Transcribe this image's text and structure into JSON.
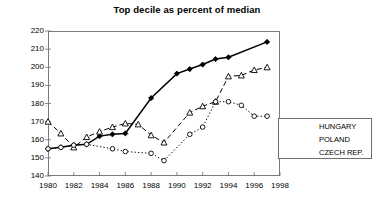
{
  "chart_data": {
    "type": "line",
    "title": "Top decile as percent of median",
    "xlabel": "",
    "ylabel": "",
    "xlim": [
      1980,
      1998
    ],
    "ylim": [
      140,
      220
    ],
    "xticks": [
      1980,
      1982,
      1984,
      1986,
      1988,
      1990,
      1992,
      1994,
      1996,
      1998
    ],
    "yticks": [
      140,
      150,
      160,
      170,
      180,
      190,
      200,
      210,
      220
    ],
    "grid": false,
    "legend_position": "right",
    "series": [
      {
        "name": "HUNGARY",
        "marker": "diamond-filled",
        "linestyle": "solid",
        "color": "#000000",
        "x": [
          1980,
          1981,
          1982,
          1983,
          1984,
          1985,
          1986,
          1988,
          1990,
          1991,
          1992,
          1993,
          1994,
          1997
        ],
        "values": [
          155,
          155.8,
          157,
          157.5,
          162,
          163,
          163.5,
          183,
          196.5,
          199,
          201.5,
          204.5,
          205.5,
          214
        ]
      },
      {
        "name": "POLAND",
        "marker": "triangle-open",
        "linestyle": "dashed",
        "color": "#000000",
        "x": [
          1980,
          1981,
          1982,
          1983,
          1984,
          1985,
          1986,
          1987,
          1988,
          1989,
          1991,
          1992,
          1993,
          1994,
          1995,
          1996,
          1997
        ],
        "values": [
          170,
          163.5,
          155.8,
          161.5,
          164.5,
          167,
          169,
          168.5,
          162.5,
          158.5,
          175,
          178.5,
          181,
          195,
          195.5,
          198.5,
          200
        ]
      },
      {
        "name": "CZECH REP.",
        "marker": "circle-open",
        "linestyle": "dotted",
        "color": "#000000",
        "x": [
          1980,
          1981,
          1982,
          1983,
          1985,
          1986,
          1988,
          1989,
          1991,
          1992,
          1993,
          1994,
          1995,
          1996,
          1997
        ],
        "values": [
          155,
          155.8,
          157,
          157.5,
          155,
          153.5,
          152.5,
          148.5,
          163,
          167,
          181,
          181,
          179,
          173,
          173
        ]
      }
    ]
  },
  "legend": {
    "items": [
      {
        "label": "HUNGARY"
      },
      {
        "label": "POLAND"
      },
      {
        "label": "CZECH REP."
      }
    ]
  }
}
